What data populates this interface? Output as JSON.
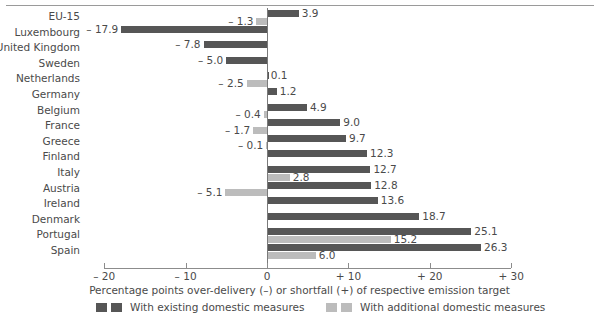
{
  "chart_data": {
    "type": "bar",
    "orientation": "horizontal",
    "title": "",
    "xlabel": "Percentage points over-delivery (–) or shortfall (+) of respective emission target",
    "ylabel": "",
    "xlim": [
      -20,
      30
    ],
    "grid": false,
    "legend_position": "bottom",
    "tick_labels": [
      "– 20",
      "– 10",
      "0",
      "+ 10",
      "+ 20",
      "+ 30"
    ],
    "tick_values": [
      -20,
      -10,
      0,
      10,
      20,
      30
    ],
    "categories": [
      "EU-15",
      "Luxembourg",
      "United Kingdom",
      "Sweden",
      "Netherlands",
      "Germany",
      "Belgium",
      "France",
      "Greece",
      "Finland",
      "Italy",
      "Austria",
      "Ireland",
      "Denmark",
      "Portugal",
      "Spain"
    ],
    "series": [
      {
        "name": "With existing domestic measures",
        "color": "#565656",
        "values": [
          3.9,
          -17.9,
          -7.8,
          -5.0,
          0.1,
          1.2,
          4.9,
          9.0,
          9.7,
          12.3,
          12.7,
          12.8,
          13.6,
          18.7,
          25.1,
          26.3
        ],
        "labels": [
          "3.9",
          "– 17.9",
          "– 7.8",
          "– 5.0",
          "0.1",
          "1.2",
          "4.9",
          "9.0",
          "9.7",
          "12.3",
          "12.7",
          "12.8",
          "13.6",
          "18.7",
          "25.1",
          "26.3"
        ]
      },
      {
        "name": "With additional domestic measures",
        "color": "#bcbcbc",
        "values": [
          -1.3,
          null,
          null,
          null,
          -2.5,
          null,
          -0.4,
          -1.7,
          -0.1,
          null,
          2.8,
          -5.1,
          null,
          null,
          15.2,
          6.0
        ],
        "labels": [
          "– 1.3",
          "",
          "",
          "",
          "– 2.5",
          "",
          "– 0.4",
          "– 1.7",
          "– 0.1",
          "",
          "2.8",
          "– 5.1",
          "",
          "",
          "15.2",
          "6.0"
        ]
      }
    ]
  },
  "legend": {
    "entries": [
      {
        "label": "With existing domestic measures",
        "color": "#565656"
      },
      {
        "label": "With additional domestic measures",
        "color": "#bcbcbc"
      }
    ]
  }
}
